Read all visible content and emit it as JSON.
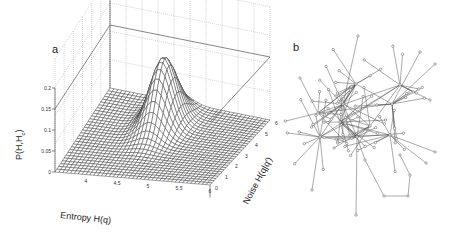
{
  "figure": {
    "panel_a_label": "a",
    "panel_b_label": "b"
  },
  "chart_data": [
    {
      "type": "surface3d",
      "panel": "a",
      "title": "",
      "zlabel": "P(H,H_c)",
      "zlabel_main": "P(H,H",
      "zlabel_sub": "c",
      "zlabel_close": ")",
      "xlabel": "Entropy H(q)",
      "ylabel": "Noise H(q|q')",
      "z_ticks": [
        "0",
        "0.05",
        "0.1",
        "0.15",
        "0.2"
      ],
      "x_ticks": [
        "4",
        "4.5",
        "5",
        "5.5",
        "6"
      ],
      "y_ticks": [
        "0",
        "1",
        "2",
        "3",
        "4",
        "5",
        "6"
      ],
      "zlim": [
        0,
        0.2
      ],
      "xlim": [
        3.5,
        6
      ],
      "ylim": [
        0,
        6
      ],
      "plane_z": 0.15,
      "peak": {
        "x": 4.6,
        "y": 4.2,
        "z": 0.16,
        "sx": 0.18,
        "sy": 0.9
      },
      "grid": true
    },
    {
      "type": "network",
      "panel": "b",
      "title": "",
      "node_style": "small open circles",
      "edge_style": "thin grey lines"
    }
  ]
}
